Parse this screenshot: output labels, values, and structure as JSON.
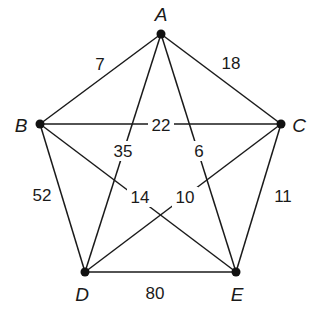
{
  "diagram": {
    "type": "weighted-complete-graph",
    "nodes": [
      {
        "id": "A",
        "label": "A",
        "x": 161,
        "y": 34,
        "lx": 161,
        "ly": 14
      },
      {
        "id": "B",
        "label": "B",
        "x": 40,
        "y": 124,
        "lx": 21,
        "ly": 125
      },
      {
        "id": "C",
        "label": "C",
        "x": 281,
        "y": 124,
        "lx": 299,
        "ly": 125
      },
      {
        "id": "D",
        "label": "D",
        "x": 85,
        "y": 272,
        "lx": 82,
        "ly": 294
      },
      {
        "id": "E",
        "label": "E",
        "x": 236,
        "y": 272,
        "lx": 237,
        "ly": 294
      }
    ],
    "edges": [
      {
        "from": "A",
        "to": "B",
        "weight": "7",
        "lx": 100,
        "ly": 64,
        "mask": false
      },
      {
        "from": "A",
        "to": "C",
        "weight": "18",
        "lx": 231,
        "ly": 63,
        "mask": false
      },
      {
        "from": "B",
        "to": "C",
        "weight": "22",
        "lx": 161,
        "ly": 125,
        "mask": true
      },
      {
        "from": "A",
        "to": "D",
        "weight": "35",
        "lx": 123,
        "ly": 151,
        "mask": true
      },
      {
        "from": "A",
        "to": "E",
        "weight": "6",
        "lx": 199,
        "ly": 151,
        "mask": true
      },
      {
        "from": "B",
        "to": "D",
        "weight": "52",
        "lx": 42,
        "ly": 195,
        "mask": false
      },
      {
        "from": "C",
        "to": "E",
        "weight": "11",
        "lx": 283,
        "ly": 196,
        "mask": false
      },
      {
        "from": "B",
        "to": "E",
        "weight": "14",
        "lx": 140,
        "ly": 197,
        "mask": true
      },
      {
        "from": "C",
        "to": "D",
        "weight": "10",
        "lx": 185,
        "ly": 197,
        "mask": true
      },
      {
        "from": "D",
        "to": "E",
        "weight": "80",
        "lx": 155,
        "ly": 293,
        "mask": false
      }
    ]
  }
}
